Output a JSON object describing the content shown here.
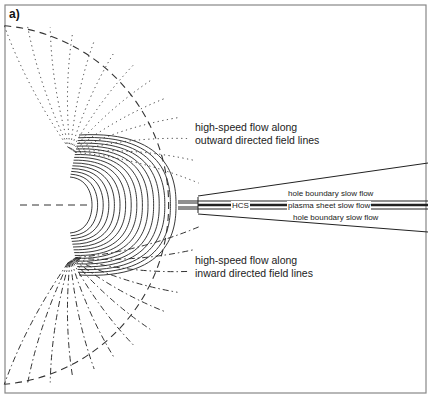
{
  "panel_label": "a)",
  "labels": {
    "outward_line1": "high-speed flow along",
    "outward_line2": "outward directed field lines",
    "inward_line1": "high-speed flow along",
    "inward_line2": "inward directed field lines",
    "hole_boundary_top": "hole boundary slow flow",
    "hole_boundary_bottom": "hole boundary slow flow",
    "hcs": "HCS",
    "plasma_sheet": "plasma sheet slow flow"
  },
  "colors": {
    "ink": "#222222",
    "frame": "#888888",
    "background": "#ffffff"
  }
}
